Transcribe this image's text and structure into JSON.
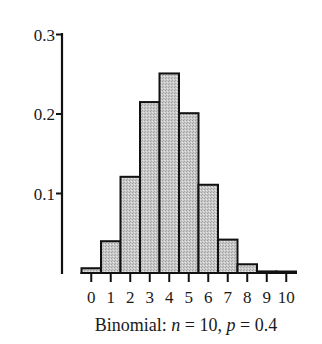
{
  "chart_data": {
    "type": "bar",
    "title": "",
    "caption": "Binomial: n = 10, p = 0.4",
    "caption_parts": {
      "prefix": "Binomial: ",
      "n_var": "n",
      "n_eq": " = 10, ",
      "p_var": "p",
      "p_eq": " = 0.4"
    },
    "xlabel": "",
    "ylabel": "",
    "categories": [
      "0",
      "1",
      "2",
      "3",
      "4",
      "5",
      "6",
      "7",
      "8",
      "9",
      "10"
    ],
    "values": [
      0.006,
      0.04,
      0.121,
      0.215,
      0.251,
      0.201,
      0.111,
      0.042,
      0.011,
      0.002,
      0.0001
    ],
    "yticks": [
      0.1,
      0.2,
      0.3
    ],
    "ytick_labels": [
      "0.1",
      "0.2",
      "0.3"
    ],
    "ylim": [
      0,
      0.3
    ],
    "grid": false,
    "legend": null,
    "colors": {
      "bar_fill": "#c4c4c4",
      "bar_stroke": "#111111",
      "axis": "#111111",
      "text": "#1a1a1a"
    }
  }
}
